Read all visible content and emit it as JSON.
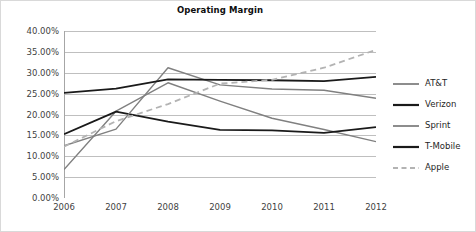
{
  "chart_data": {
    "type": "line",
    "title": "Operating Margin",
    "xlabel": "",
    "ylabel": "",
    "categories": [
      "2006",
      "2007",
      "2008",
      "2009",
      "2010",
      "2011",
      "2012"
    ],
    "ylim": [
      0,
      40
    ],
    "y_ticks": [
      0,
      5,
      10,
      15,
      20,
      25,
      30,
      35,
      40
    ],
    "y_tick_labels": [
      "0.00%",
      "5.00%",
      "10.00%",
      "15.00%",
      "20.00%",
      "25.00%",
      "30.00%",
      "35.00%",
      "40.00%"
    ],
    "y_tick_format": "percent",
    "grid": "horizontal",
    "legend_position": "right",
    "series": [
      {
        "name": "AT&T",
        "values": [
          6.8,
          20.8,
          27.6,
          23.2,
          19.1,
          16.4,
          13.5
        ],
        "color": "#808080",
        "style": "solid",
        "width": 1.4
      },
      {
        "name": "Verizon",
        "values": [
          15.3,
          20.7,
          18.3,
          16.3,
          16.2,
          15.6,
          17.0
        ],
        "color": "#1a1a1a",
        "style": "solid",
        "width": 1.8
      },
      {
        "name": "Sprint",
        "values": [
          12.5,
          16.5,
          31.2,
          27.1,
          26.1,
          25.8,
          23.9
        ],
        "color": "#808080",
        "style": "solid",
        "width": 1.4
      },
      {
        "name": "T-Mobile",
        "values": [
          25.2,
          26.2,
          28.4,
          28.3,
          28.2,
          28.0,
          29.0
        ],
        "color": "#1a1a1a",
        "style": "solid",
        "width": 1.8
      },
      {
        "name": "Apple",
        "values": [
          12.3,
          18.4,
          22.5,
          27.4,
          28.3,
          31.2,
          35.5
        ],
        "color": "#b3b3b3",
        "style": "dashed",
        "width": 1.8
      }
    ]
  },
  "legend": {
    "items": [
      {
        "label": "AT&T"
      },
      {
        "label": "Verizon"
      },
      {
        "label": "Sprint"
      },
      {
        "label": "T-Mobile"
      },
      {
        "label": "Apple"
      }
    ]
  },
  "axis_colors": {
    "gridline": "#bfbfbf",
    "axis_line": "#a6a6a6",
    "tick_text": "#3f3f3f"
  }
}
